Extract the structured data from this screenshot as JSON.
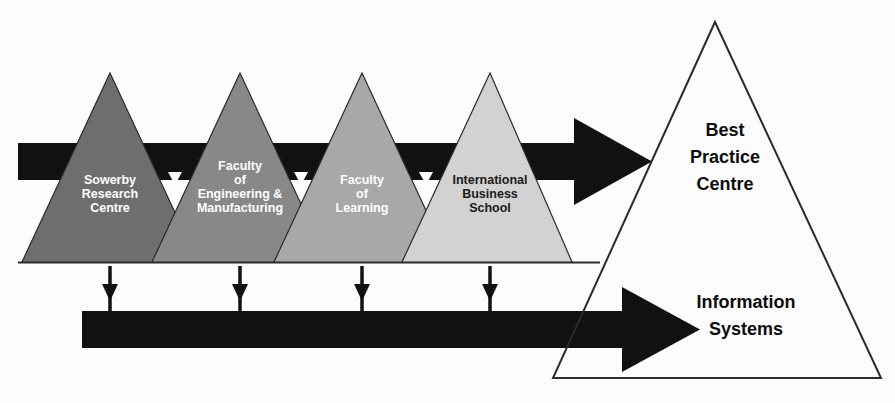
{
  "diagram": {
    "background_color": "#fcfcfc",
    "outline_color": "#2b2b2b",
    "arrow_color": "#111111"
  },
  "units": [
    {
      "id": "sowerby-research-centre",
      "lines": [
        "Sowerby",
        "Research",
        "Centre"
      ],
      "fill": "#6e6e6e",
      "text_color": "#ffffff",
      "apex_x": 110,
      "base_left": 22,
      "base_right": 198,
      "apex_y": 73,
      "base_y": 262
    },
    {
      "id": "faculty-of-engineering-and-manufacturing",
      "lines": [
        "Faculty",
        "of",
        "Engineering &",
        "Manufacturing"
      ],
      "fill": "#888888",
      "text_color": "#ffffff",
      "apex_x": 240,
      "base_left": 152,
      "base_right": 328,
      "apex_y": 73,
      "base_y": 262
    },
    {
      "id": "faculty-of-learning",
      "lines": [
        "Faculty",
        "of",
        "Learning"
      ],
      "fill": "#a8a8a8",
      "text_color": "#ffffff",
      "apex_x": 362,
      "base_left": 274,
      "base_right": 450,
      "apex_y": 73,
      "base_y": 262
    },
    {
      "id": "international-business-school",
      "lines": [
        "International",
        "Business",
        "School"
      ],
      "fill": "#d2d2d2",
      "text_color": "#1a1a1a",
      "apex_x": 490,
      "base_left": 402,
      "base_right": 572,
      "apex_y": 73,
      "base_y": 262
    }
  ],
  "big_triangle": {
    "id": "best-practice-centre",
    "apex_x": 715,
    "apex_y": 22,
    "base_left": 553,
    "base_right": 881,
    "base_y": 378,
    "fill": "#ffffff",
    "stroke": "#2b2b2b"
  },
  "labels": {
    "best_practice_centre": [
      "Best",
      "Practice",
      "Centre"
    ],
    "information_systems": [
      "Information",
      "Systems"
    ]
  },
  "arrows": {
    "top": {
      "name": "best-practice-flow-arrow",
      "x_start": 18,
      "x_end": 652,
      "shaft_top": 143,
      "shaft_bottom": 180,
      "head_start": 574,
      "head_top": 118,
      "head_bottom": 205
    },
    "bottom": {
      "name": "information-systems-flow-arrow",
      "x_start": 82,
      "x_end": 700,
      "shaft_top": 311,
      "shaft_bottom": 348,
      "head_start": 622,
      "head_top": 287,
      "head_bottom": 372
    },
    "verticals": [
      {
        "name": "drop-arrow-1",
        "x": 110,
        "y_top": 266,
        "y_bottom": 316
      },
      {
        "name": "drop-arrow-2",
        "x": 240,
        "y_top": 266,
        "y_bottom": 316
      },
      {
        "name": "drop-arrow-3",
        "x": 362,
        "y_top": 266,
        "y_bottom": 316
      },
      {
        "name": "drop-arrow-4",
        "x": 490,
        "y_top": 266,
        "y_bottom": 316
      }
    ]
  }
}
